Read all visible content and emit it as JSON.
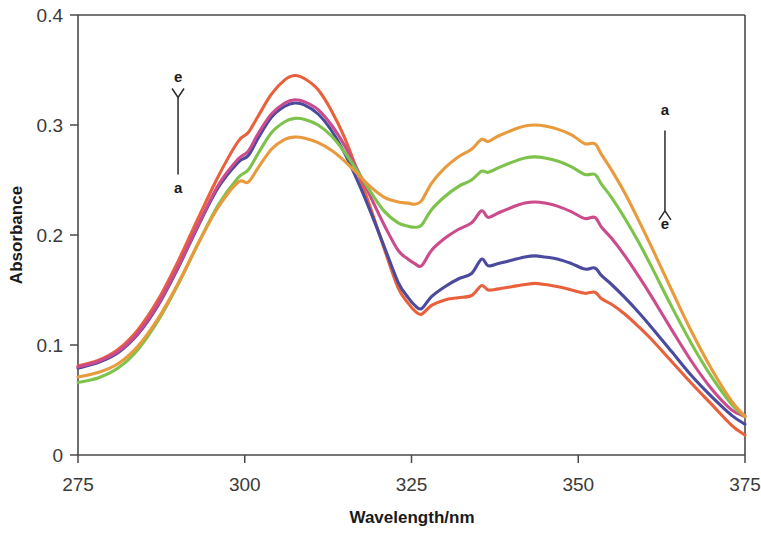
{
  "chart_data": {
    "type": "line",
    "title": "",
    "xlabel": "Wavelength/nm",
    "ylabel": "Absorbance",
    "xlim": [
      275,
      375
    ],
    "ylim": [
      0,
      0.4
    ],
    "xticks": [
      275,
      300,
      325,
      350,
      375
    ],
    "xtick_labels": [
      "275",
      "300",
      "325",
      "350",
      "375"
    ],
    "yticks": [
      0,
      0.1,
      0.2,
      0.3,
      0.4
    ],
    "ytick_labels": [
      "0",
      "0.1",
      "0.2",
      "0.3",
      "0.4"
    ],
    "grid": false,
    "legend": "none",
    "annotations": [
      {
        "name": "left-arrow",
        "direction": "up",
        "top_label": "e",
        "bottom_label": "a",
        "x_nm": 290,
        "y_from": 0.255,
        "y_to": 0.325
      },
      {
        "name": "right-arrow",
        "direction": "down",
        "top_label": "a",
        "bottom_label": "e",
        "x_nm": 363,
        "y_from": 0.295,
        "y_to": 0.222
      }
    ],
    "series": [
      {
        "name": "a",
        "color": "#E8613C",
        "peak1_nm": 307,
        "peak1_value": 0.345,
        "peak2_nm": 343,
        "peak2_value": 0.156,
        "trough_nm": 326,
        "trough_value": 0.128,
        "x": [
          275,
          278,
          281,
          284,
          287,
          290,
          293,
          296,
          299,
          300.5,
          302,
          304,
          306,
          307.5,
          309,
          311,
          313,
          315,
          317,
          319,
          321,
          323,
          324.5,
          325.5,
          326.5,
          328,
          330,
          332,
          334,
          335.5,
          336.5,
          338,
          340,
          342,
          343.5,
          345,
          347,
          349,
          351,
          352.5,
          353.5,
          355,
          357,
          359,
          361,
          364,
          367,
          370,
          373,
          375
        ],
        "y": [
          0.081,
          0.086,
          0.096,
          0.114,
          0.141,
          0.176,
          0.215,
          0.253,
          0.285,
          0.293,
          0.308,
          0.328,
          0.341,
          0.345,
          0.342,
          0.332,
          0.313,
          0.288,
          0.256,
          0.222,
          0.186,
          0.152,
          0.138,
          0.131,
          0.128,
          0.136,
          0.141,
          0.143,
          0.145,
          0.154,
          0.15,
          0.151,
          0.153,
          0.155,
          0.156,
          0.155,
          0.153,
          0.15,
          0.147,
          0.148,
          0.142,
          0.137,
          0.128,
          0.117,
          0.105,
          0.085,
          0.065,
          0.046,
          0.027,
          0.018
        ]
      },
      {
        "name": "b",
        "color": "#4A4A9E",
        "peak1_nm": 307.5,
        "peak1_value": 0.32,
        "peak2_nm": 343,
        "peak2_value": 0.181,
        "trough_nm": 326,
        "trough_value": 0.133,
        "x": [
          275,
          278,
          281,
          284,
          287,
          290,
          293,
          296,
          299,
          300.5,
          302,
          304,
          306,
          307.5,
          309,
          311,
          313,
          315,
          317,
          319,
          321,
          323,
          324.5,
          325.5,
          326.5,
          328,
          330,
          332,
          334,
          335.5,
          336.5,
          338,
          340,
          342,
          343.5,
          345,
          347,
          349,
          351,
          352.5,
          353.5,
          355,
          357,
          359,
          361,
          364,
          367,
          370,
          373,
          375
        ],
        "y": [
          0.079,
          0.084,
          0.093,
          0.11,
          0.136,
          0.17,
          0.208,
          0.243,
          0.266,
          0.272,
          0.288,
          0.307,
          0.317,
          0.32,
          0.318,
          0.31,
          0.295,
          0.274,
          0.248,
          0.219,
          0.188,
          0.157,
          0.143,
          0.136,
          0.133,
          0.144,
          0.153,
          0.16,
          0.165,
          0.178,
          0.172,
          0.174,
          0.177,
          0.18,
          0.181,
          0.18,
          0.178,
          0.174,
          0.169,
          0.17,
          0.163,
          0.155,
          0.143,
          0.13,
          0.116,
          0.094,
          0.072,
          0.053,
          0.036,
          0.028
        ]
      },
      {
        "name": "c",
        "color": "#CC4B8C",
        "peak1_nm": 307.5,
        "peak1_value": 0.323,
        "peak2_nm": 343,
        "peak2_value": 0.23,
        "trough_nm": 326,
        "trough_value": 0.172,
        "x": [
          275,
          278,
          281,
          284,
          287,
          290,
          293,
          296,
          299,
          300.5,
          302,
          304,
          306,
          307.5,
          309,
          311,
          313,
          315,
          317,
          319,
          321,
          323,
          324.5,
          325.5,
          326.5,
          328,
          330,
          332,
          334,
          335.5,
          336.5,
          338,
          340,
          342,
          343.5,
          345,
          347,
          349,
          351,
          352.5,
          353.5,
          355,
          357,
          359,
          361,
          364,
          367,
          370,
          373,
          375
        ],
        "y": [
          0.08,
          0.085,
          0.094,
          0.111,
          0.137,
          0.171,
          0.209,
          0.245,
          0.269,
          0.276,
          0.292,
          0.31,
          0.32,
          0.323,
          0.321,
          0.314,
          0.3,
          0.281,
          0.258,
          0.233,
          0.208,
          0.186,
          0.178,
          0.174,
          0.172,
          0.186,
          0.197,
          0.205,
          0.211,
          0.222,
          0.216,
          0.22,
          0.225,
          0.229,
          0.23,
          0.229,
          0.226,
          0.221,
          0.215,
          0.216,
          0.207,
          0.197,
          0.181,
          0.163,
          0.144,
          0.114,
          0.085,
          0.06,
          0.041,
          0.035
        ]
      },
      {
        "name": "d",
        "color": "#7DC24B",
        "peak1_nm": 308,
        "peak1_value": 0.306,
        "peak2_nm": 343,
        "peak2_value": 0.271,
        "trough_nm": 326,
        "trough_value": 0.207,
        "x": [
          275,
          278,
          281,
          284,
          287,
          290,
          293,
          296,
          299,
          300.5,
          302,
          304,
          306,
          307.5,
          309,
          311,
          313,
          315,
          317,
          319,
          321,
          323,
          324.5,
          325.5,
          326.5,
          328,
          330,
          332,
          334,
          335.5,
          336.5,
          338,
          340,
          342,
          343.5,
          345,
          347,
          349,
          351,
          352.5,
          353.5,
          355,
          357,
          359,
          361,
          364,
          367,
          370,
          373,
          375
        ],
        "y": [
          0.066,
          0.07,
          0.079,
          0.096,
          0.122,
          0.155,
          0.192,
          0.227,
          0.252,
          0.259,
          0.274,
          0.293,
          0.303,
          0.306,
          0.305,
          0.3,
          0.29,
          0.275,
          0.257,
          0.238,
          0.221,
          0.211,
          0.208,
          0.207,
          0.209,
          0.223,
          0.235,
          0.244,
          0.25,
          0.258,
          0.257,
          0.261,
          0.266,
          0.27,
          0.271,
          0.27,
          0.267,
          0.262,
          0.255,
          0.255,
          0.246,
          0.234,
          0.215,
          0.194,
          0.171,
          0.135,
          0.101,
          0.071,
          0.046,
          0.035
        ]
      },
      {
        "name": "e",
        "color": "#E89A3C",
        "peak1_nm": 308,
        "peak1_value": 0.289,
        "peak2_nm": 343,
        "peak2_value": 0.3,
        "trough_nm": 326,
        "trough_value": 0.228,
        "x": [
          275,
          278,
          281,
          284,
          287,
          290,
          293,
          296,
          299,
          300.5,
          302,
          304,
          306,
          307.5,
          309,
          311,
          313,
          315,
          317,
          319,
          321,
          323,
          324.5,
          325.5,
          326.5,
          328,
          330,
          332,
          334,
          335.5,
          336.5,
          338,
          340,
          342,
          343.5,
          345,
          347,
          349,
          351,
          352.5,
          353.5,
          355,
          357,
          359,
          361,
          364,
          367,
          370,
          373,
          375
        ],
        "y": [
          0.071,
          0.075,
          0.083,
          0.099,
          0.124,
          0.156,
          0.192,
          0.225,
          0.248,
          0.248,
          0.261,
          0.278,
          0.287,
          0.289,
          0.288,
          0.284,
          0.277,
          0.267,
          0.255,
          0.243,
          0.234,
          0.23,
          0.229,
          0.228,
          0.231,
          0.247,
          0.261,
          0.271,
          0.278,
          0.287,
          0.285,
          0.29,
          0.295,
          0.299,
          0.3,
          0.299,
          0.296,
          0.291,
          0.283,
          0.283,
          0.273,
          0.259,
          0.238,
          0.214,
          0.189,
          0.15,
          0.112,
          0.078,
          0.049,
          0.035
        ]
      }
    ]
  },
  "axes": {
    "y_title": "Absorbance",
    "x_title": "Wavelength/nm"
  },
  "annotation_labels": {
    "left_top": "e",
    "left_bottom": "a",
    "right_top": "a",
    "right_bottom": "e"
  }
}
